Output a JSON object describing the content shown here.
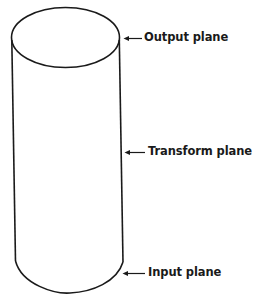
{
  "diagram": {
    "labels": {
      "output": "Output plane",
      "transform": "Transform plane",
      "input": "Input plane"
    },
    "colors": {
      "stroke": "#1a1a1a",
      "background": "#ffffff"
    }
  }
}
